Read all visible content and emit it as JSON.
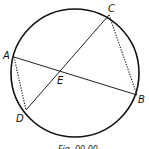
{
  "diagram": {
    "type": "circle-with-intersecting-chords",
    "circle": {
      "cx": 75,
      "cy": 73,
      "r": 64
    },
    "points": {
      "A": {
        "label": "A",
        "x": 14,
        "y": 57
      },
      "B": {
        "label": "B",
        "x": 137,
        "y": 95
      },
      "C": {
        "label": "C",
        "x": 109,
        "y": 15
      },
      "D": {
        "label": "D",
        "x": 26,
        "y": 110
      },
      "E": {
        "label": "E",
        "x": 61,
        "y": 70
      }
    },
    "chords": [
      {
        "from": "A",
        "to": "B",
        "style": "solid"
      },
      {
        "from": "C",
        "to": "D",
        "style": "solid"
      }
    ],
    "dotted_segments": [
      {
        "from": "A",
        "to": "D"
      },
      {
        "from": "C",
        "to": "B"
      }
    ],
    "caption": "Fig. 00.00"
  }
}
